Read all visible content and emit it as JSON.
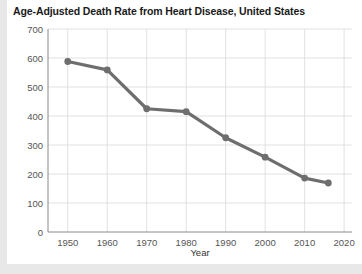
{
  "chart_data": {
    "type": "line",
    "title": "Age-Adjusted Death Rate from Heart Disease, United States",
    "xlabel": "Year",
    "ylabel": "",
    "xlim": [
      1945,
      2022
    ],
    "ylim": [
      0,
      700
    ],
    "grid": true,
    "legend": "none",
    "line_color": "#6e6e6e",
    "marker_color": "#6e6e6e",
    "x": [
      1950,
      1960,
      1970,
      1980,
      1990,
      2000,
      2010,
      2016
    ],
    "values": [
      588,
      559,
      425,
      415,
      325,
      258,
      186,
      169
    ],
    "series": [
      {
        "name": "Age-adjusted death rate",
        "x": [
          1950,
          1960,
          1970,
          1980,
          1990,
          2000,
          2010,
          2016
        ],
        "values": [
          588,
          559,
          425,
          415,
          325,
          258,
          186,
          169
        ]
      }
    ],
    "ytick_labels": [
      "0",
      "100",
      "200",
      "300",
      "400",
      "500",
      "600",
      "700"
    ],
    "ytick_values": [
      0,
      100,
      200,
      300,
      400,
      500,
      600,
      700
    ],
    "xtick_labels": [
      "1950",
      "1960",
      "1970",
      "1980",
      "1990",
      "2000",
      "2010",
      "2020"
    ],
    "xtick_values": [
      1950,
      1960,
      1970,
      1980,
      1990,
      2000,
      2010,
      2020
    ]
  },
  "colors": {
    "page_background": "#e8e8e8",
    "card_background": "#ffffff",
    "gridline": "#d9d9d9",
    "axis": "#8a8a8a",
    "tick_text": "#555555",
    "title_text": "#1a1a1a"
  }
}
